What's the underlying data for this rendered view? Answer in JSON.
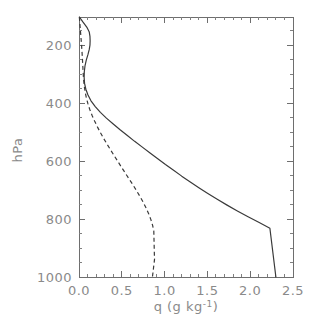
{
  "chart_data": {
    "type": "line",
    "title": "",
    "subtitle": "",
    "xlabel": "q (g kg",
    "xlabel_sup": "-1",
    "xlabel_tail": ")",
    "xlabel_full": "q (g kg⁻¹)",
    "ylabel": "hPa",
    "xlim": [
      0.0,
      2.5
    ],
    "ylim": [
      1000,
      103
    ],
    "y_inverted": true,
    "grid": false,
    "legend": "none",
    "xticks": [
      0.0,
      0.5,
      1.0,
      1.5,
      2.0,
      2.5
    ],
    "xticklabels": [
      "0.0",
      "0.5",
      "1.0",
      "1.5",
      "2.0",
      "2.5"
    ],
    "x_minor_interval": 0.1,
    "yticks": [
      200,
      400,
      600,
      800,
      1000
    ],
    "yticklabels": [
      "200",
      "400",
      "600",
      "800",
      "1000"
    ],
    "y_minor_interval": 50,
    "series": [
      {
        "name": "solid-profile",
        "style": "solid",
        "color": "#3a3a3a",
        "x": [
          0.005,
          0.045,
          0.095,
          0.12,
          0.128,
          0.13,
          0.128,
          0.12,
          0.105,
          0.085,
          0.07,
          0.062,
          0.06,
          0.065,
          0.08,
          0.105,
          0.14,
          0.19,
          0.25,
          0.32,
          0.4,
          0.48,
          0.565,
          0.65,
          0.74,
          0.83,
          0.92,
          1.01,
          1.105,
          1.2,
          1.3,
          1.4,
          1.505,
          1.615,
          1.73,
          1.85,
          1.975,
          2.105,
          2.23,
          2.3
        ],
        "y": [
          103,
          120,
          140,
          155,
          170,
          185,
          200,
          215,
          232,
          252,
          272,
          292,
          312,
          332,
          352,
          372,
          392,
          412,
          432,
          452,
          472,
          492,
          512,
          532,
          552,
          572,
          592,
          612,
          632,
          652,
          672,
          692,
          712,
          732,
          752,
          772,
          792,
          812,
          832,
          1000
        ]
      },
      {
        "name": "dashed-profile",
        "style": "dashed",
        "color": "#3a3a3a",
        "x": [
          0.004,
          0.01,
          0.016,
          0.022,
          0.028,
          0.033,
          0.038,
          0.042,
          0.046,
          0.05,
          0.055,
          0.062,
          0.072,
          0.086,
          0.104,
          0.126,
          0.152,
          0.182,
          0.215,
          0.25,
          0.288,
          0.328,
          0.37,
          0.412,
          0.455,
          0.498,
          0.542,
          0.586,
          0.63,
          0.672,
          0.712,
          0.75,
          0.784,
          0.814,
          0.84,
          0.86,
          0.874,
          0.882,
          0.87,
          0.858
        ],
        "y": [
          103,
          125,
          148,
          170,
          192,
          214,
          236,
          258,
          280,
          302,
          322,
          342,
          362,
          382,
          402,
          422,
          442,
          462,
          482,
          502,
          522,
          542,
          562,
          582,
          602,
          622,
          642,
          662,
          682,
          702,
          722,
          742,
          762,
          782,
          802,
          822,
          842,
          940,
          970,
          1000
        ]
      }
    ]
  },
  "axes": {
    "x_title": "q (g kg",
    "y_title": "hPa"
  }
}
